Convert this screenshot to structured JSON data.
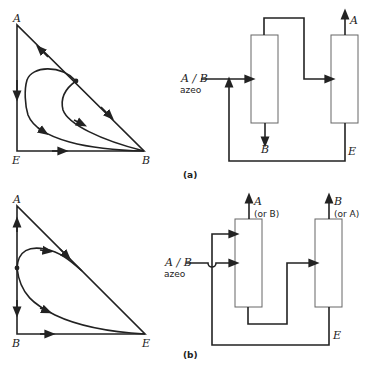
{
  "figure_a": {
    "caption": "(a)",
    "triangle": {
      "vertices": {
        "top": "A",
        "bottom_left": "E",
        "bottom_right": "B"
      }
    },
    "flowsheet": {
      "feed_label_1": "A / B",
      "feed_label_2": "azeo",
      "column1_bottom": "B",
      "column2_top": "A",
      "recycle_label": "E"
    }
  },
  "figure_b": {
    "caption": "(b)",
    "triangle": {
      "vertices": {
        "top": "A",
        "bottom_left": "B",
        "bottom_right": "E"
      }
    },
    "flowsheet": {
      "feed_label_1": "A / B",
      "feed_label_2": "azeo",
      "column1_top_1": "A",
      "column1_top_2": "(or B)",
      "column2_top_1": "B",
      "column2_top_2": "(or A)",
      "recycle_label": "E"
    }
  }
}
